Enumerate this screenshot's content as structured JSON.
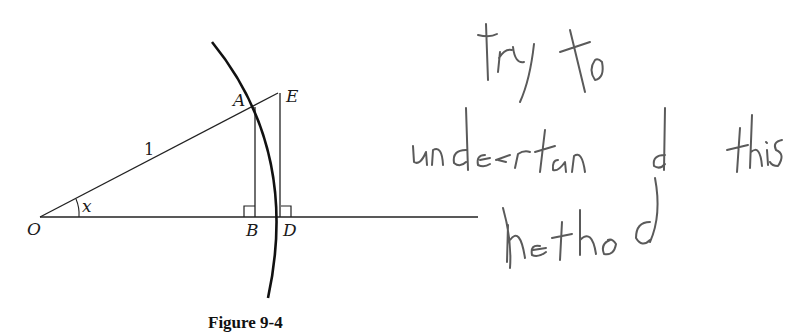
{
  "figure": {
    "caption": "Figure 9-4",
    "labels": {
      "O": "O",
      "A": "A",
      "B": "B",
      "D": "D",
      "E": "E",
      "angle": "x",
      "radius": "1"
    },
    "elements": [
      "unit circle arc through A and D centered at O",
      "segment OA of length 1 extended to E",
      "perpendicular AB to OD with right-angle mark",
      "tangent segment ED perpendicular to OD with right-angle mark",
      "angle x at O between OD and OA",
      "horizontal baseline through O, B, D"
    ]
  },
  "annotation": {
    "type": "handwritten",
    "lines": [
      "try to",
      "understand this",
      "method"
    ],
    "text": "try to understand this method",
    "color": "#5a5a5a"
  }
}
